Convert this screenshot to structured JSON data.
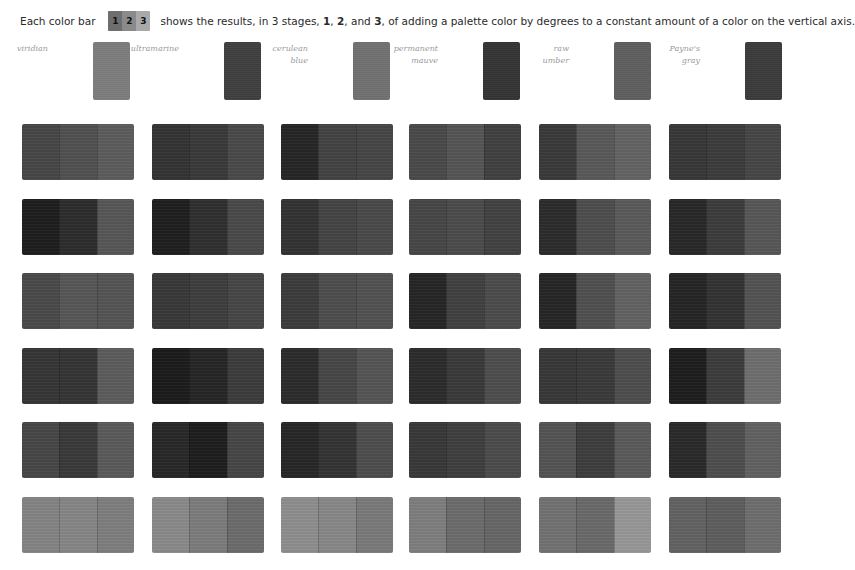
{
  "caption": {
    "prefix": "Each color bar",
    "legend_swatch": {
      "segments": [
        {
          "label": "1",
          "color": "#6e6e6e"
        },
        {
          "label": "2",
          "color": "#8a8a8a"
        },
        {
          "label": "3",
          "color": "#a9a9a9"
        }
      ]
    },
    "text_a": "shows the results, in 3 stages,",
    "stage1": "1",
    "text_b": ",",
    "stage2": "2",
    "text_c": ", and",
    "stage3": "3",
    "text_d": ", of adding a palette color by degrees to a constant amount of a color on the vertical axis."
  },
  "palette": [
    {
      "name": "viridian",
      "label": "viridian",
      "color": "#7c7c7c",
      "x": 93
    },
    {
      "name": "ultramarine",
      "label": "ultramarine",
      "color": "#3e3e3e",
      "x": 224
    },
    {
      "name": "cerulean-blue",
      "label": "cerulean\nblue",
      "color": "#707070",
      "x": 353
    },
    {
      "name": "permanent-mauve",
      "label": "permanent\nmauve",
      "color": "#333333",
      "x": 483
    },
    {
      "name": "raw-umber",
      "label": "raw\number",
      "color": "#5e5e5e",
      "x": 614
    },
    {
      "name": "paynes-gray",
      "label": "Payne's\ngray",
      "color": "#3a3a3a",
      "x": 745
    }
  ],
  "grid": {
    "col_x": [
      22,
      152,
      281,
      409,
      539,
      669
    ],
    "row_y": [
      124,
      199,
      273,
      348,
      422,
      497
    ],
    "rows": [
      [
        [
          "#474747",
          "#515151",
          "#5c5c5c"
        ],
        [
          "#343434",
          "#3a3a3a",
          "#4a4a4a"
        ],
        [
          "#262626",
          "#434343",
          "#464646"
        ],
        [
          "#4a4a4a",
          "#555555",
          "#414141"
        ],
        [
          "#3a3a3a",
          "#595959",
          "#636363"
        ],
        [
          "#383838",
          "#3c3c3c",
          "#464646"
        ]
      ],
      [
        [
          "#1e1e1e",
          "#2d2d2d",
          "#575757"
        ],
        [
          "#1f1f1f",
          "#303030",
          "#4a4a4a"
        ],
        [
          "#333333",
          "#444444",
          "#4a4a4a"
        ],
        [
          "#474747",
          "#4c4c4c",
          "#424242"
        ],
        [
          "#2c2c2c",
          "#4e4e4e",
          "#5a5a5a"
        ],
        [
          "#282828",
          "#3c3c3c",
          "#575757"
        ]
      ],
      [
        [
          "#4a4a4a",
          "#575757",
          "#555555"
        ],
        [
          "#393939",
          "#3e3e3e",
          "#474747"
        ],
        [
          "#3c3c3c",
          "#4e4e4e",
          "#525252"
        ],
        [
          "#262626",
          "#414141",
          "#4c4c4c"
        ],
        [
          "#262626",
          "#505050",
          "#626262"
        ],
        [
          "#252525",
          "#333333",
          "#535353"
        ]
      ],
      [
        [
          "#363636",
          "#353535",
          "#5c5c5c"
        ],
        [
          "#1c1c1c",
          "#262626",
          "#3c3c3c"
        ],
        [
          "#2c2c2c",
          "#474747",
          "#555555"
        ],
        [
          "#2c2c2c",
          "#3a3a3a",
          "#4e4e4e"
        ],
        [
          "#383838",
          "#3a3a3a",
          "#4e4e4e"
        ],
        [
          "#1e1e1e",
          "#3c3c3c",
          "#6e6e6e"
        ]
      ],
      [
        [
          "#474747",
          "#3a3a3a",
          "#5a5a5a"
        ],
        [
          "#282828",
          "#1e1e1e",
          "#464646"
        ],
        [
          "#272727",
          "#343434",
          "#4e4e4e"
        ],
        [
          "#393939",
          "#3f3f3f",
          "#4c4c4c"
        ],
        [
          "#545454",
          "#3e3e3e",
          "#5a5a5a"
        ],
        [
          "#2a2a2a",
          "#4e4e4e",
          "#616161"
        ]
      ],
      [
        [
          "#848484",
          "#868686",
          "#7e7e7e"
        ],
        [
          "#8a8a8a",
          "#7c7c7c",
          "#6c6c6c"
        ],
        [
          "#8e8e8e",
          "#888888",
          "#7a7a7a"
        ],
        [
          "#7e7e7e",
          "#6c6c6c",
          "#676767"
        ],
        [
          "#727272",
          "#6a6a6a",
          "#979797"
        ],
        [
          "#626262",
          "#5e5e5e",
          "#6e6e6e"
        ]
      ]
    ]
  }
}
